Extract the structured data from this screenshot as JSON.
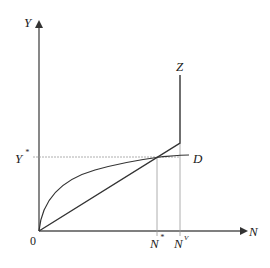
{
  "diagram": {
    "axes": {
      "y_label": "Y",
      "x_label": "N",
      "origin_label": "0"
    },
    "labels": {
      "y_star": "Y",
      "y_star_sup": "*",
      "n_star": "N",
      "n_star_sup": "*",
      "n_v": "N",
      "n_v_sup": "V",
      "curve_d": "D",
      "line_z": "Z"
    },
    "colors": {
      "axis": "#444444",
      "curve": "#333333",
      "guide": "#9a9a9a"
    }
  }
}
